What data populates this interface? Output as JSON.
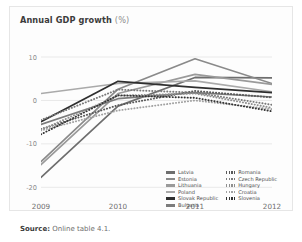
{
  "chart_data": {
    "type": "line",
    "title": "Annual GDP growth",
    "title_unit": "(%)",
    "xlabel": "",
    "ylabel": "",
    "x": [
      "2009",
      "2010",
      "2011",
      "2012"
    ],
    "xtick_labels": [
      "2009",
      "2010",
      "2011",
      "2012"
    ],
    "ytick_labels": [
      "10",
      "0",
      "-10",
      "-20"
    ],
    "yticks": [
      10,
      0,
      -10,
      -20
    ],
    "ylim": [
      -22,
      13
    ],
    "grid": "horizontal",
    "legend_position": "bottom-right",
    "series": [
      {
        "name": "Latvia",
        "values": [
          -17.7,
          -1.3,
          5.3,
          5.2
        ],
        "style": "solid",
        "color": "#6e6e6e"
      },
      {
        "name": "Estonia",
        "values": [
          -14.1,
          2.6,
          9.6,
          3.9
        ],
        "style": "solid",
        "color": "#8a8a8a"
      },
      {
        "name": "Lithuania",
        "values": [
          -14.8,
          1.6,
          6.0,
          3.7
        ],
        "style": "solid",
        "color": "#9a9a9a"
      },
      {
        "name": "Poland",
        "values": [
          1.6,
          3.9,
          4.5,
          2.0
        ],
        "style": "solid",
        "color": "#aaaaaa"
      },
      {
        "name": "Slovak Republic",
        "values": [
          -4.9,
          4.4,
          3.0,
          1.8
        ],
        "style": "solid",
        "color": "#2f2f2f"
      },
      {
        "name": "Bulgaria",
        "values": [
          -5.5,
          0.4,
          1.8,
          0.8
        ],
        "style": "solid",
        "color": "#7c7c7c"
      },
      {
        "name": "Romania",
        "values": [
          -6.6,
          -1.1,
          2.2,
          0.7
        ],
        "style": "dotted",
        "color": "#5a5a5a"
      },
      {
        "name": "Czech Republic",
        "values": [
          -4.5,
          2.5,
          1.8,
          -1.0
        ],
        "style": "dotted",
        "color": "#7a7a7a"
      },
      {
        "name": "Hungary",
        "values": [
          -6.8,
          1.1,
          1.6,
          -1.7
        ],
        "style": "dotted",
        "color": "#8f8f8f"
      },
      {
        "name": "Croatia",
        "values": [
          -6.9,
          -2.3,
          0.0,
          -2.0
        ],
        "style": "dotted",
        "color": "#a2a2a2"
      },
      {
        "name": "Slovenia",
        "values": [
          -7.8,
          1.2,
          0.6,
          -2.5
        ],
        "style": "dotted",
        "color": "#333333"
      }
    ]
  },
  "legend": {
    "columns": [
      [
        "Latvia",
        "Estonia",
        "Lithuania",
        "Poland",
        "Slovak Republic",
        "Bulgaria"
      ],
      [
        "Romania",
        "Czech Republic",
        "Hungary",
        "Croatia",
        "Slovenia"
      ]
    ]
  },
  "source": {
    "label": "Source:",
    "text": "Online table 4.1."
  }
}
